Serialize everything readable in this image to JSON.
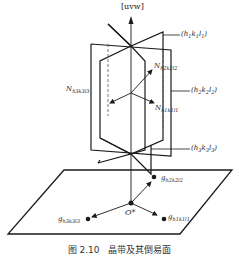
{
  "figure": {
    "zone_axis_label": "[uvw]",
    "origin_label": "O*",
    "caption": "图 2.10　晶带及其倒易面",
    "planes": [
      {
        "id": "plane1",
        "label": "(h1k1l1)",
        "h": "h",
        "s1": "1",
        "k": "k",
        "s2": "1",
        "l": "l",
        "s3": "1"
      },
      {
        "id": "plane2",
        "label": "(h2k2l2)",
        "h": "h",
        "s1": "2",
        "k": "k",
        "s2": "2",
        "l": "l",
        "s3": "2"
      },
      {
        "id": "plane3",
        "label": "(h3k3l3)",
        "h": "h",
        "s1": "3",
        "k": "k",
        "s2": "3",
        "l": "l",
        "s3": "3"
      }
    ],
    "normals": [
      {
        "id": "N1",
        "label": "N h1k1l1",
        "base": "N",
        "sub": "h1k1l1"
      },
      {
        "id": "N2",
        "label": "N h2k2l2",
        "base": "N",
        "sub": "h2k2l2"
      },
      {
        "id": "N3",
        "label": "N h3k3l3",
        "base": "N",
        "sub": "h3k3l3"
      }
    ],
    "reciprocal_vectors": [
      {
        "id": "g1",
        "label": "g h1k1l1",
        "base": "g",
        "sub": "h1k1l1"
      },
      {
        "id": "g2",
        "label": "g h2k2l2",
        "base": "g",
        "sub": "h2k2l2"
      },
      {
        "id": "g3",
        "label": "g h3k3l3",
        "base": "g",
        "sub": "h3k3l3"
      }
    ],
    "colors": {
      "line": "#1a1a1a",
      "dashed": "#555555",
      "background": "#ffffff"
    }
  }
}
